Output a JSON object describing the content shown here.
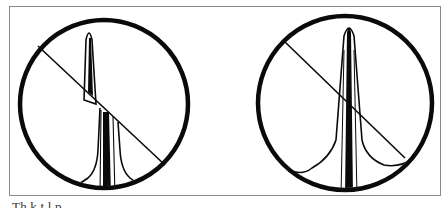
{
  "figure": {
    "frame_color": "#8a8a8a",
    "ink_color": "#0a0a0a",
    "panels": [
      {
        "id": "left",
        "description": "circle with diagonal line; vertical spike offset where it crosses the line",
        "circle": {
          "cx": 104,
          "cy": 104,
          "r": 84
        },
        "diagonal": {
          "x1": 38,
          "y1": 46,
          "x2": 165,
          "y2": 165
        },
        "spike_peak": {
          "x": 89,
          "y": 30
        }
      },
      {
        "id": "right",
        "description": "circle with diagonal line; continuous vertical spike with broad wavy base",
        "circle": {
          "cx": 345,
          "cy": 103,
          "r": 87
        },
        "diagonal": {
          "x1": 285,
          "y1": 42,
          "x2": 405,
          "y2": 158
        },
        "spike_peak": {
          "x": 349,
          "y": 25
        }
      }
    ]
  },
  "caption": {
    "text": "The k... (caption text cut off at image edge)",
    "visible_fragment": "Th  k  t  l  p  "
  }
}
